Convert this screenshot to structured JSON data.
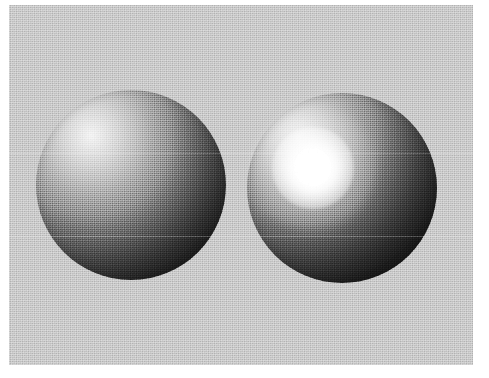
{
  "figure": {
    "kind": "shaded-sphere-illustration",
    "canvas": {
      "width": 489,
      "height": 378
    },
    "page_background": "#ffffff"
  },
  "panel": {
    "name": "scanned-image-panel",
    "x": 9,
    "y": 5,
    "width": 464,
    "height": 360,
    "background_color": "#c2c2c2",
    "texture": "halftone-dither"
  },
  "lighting": {
    "direction": "upper-left",
    "light_position_hint": "above and to the left of the viewer",
    "ambient_note": "terminator falls off to near-black toward the lower-right of each sphere"
  },
  "objects": [
    {
      "id": "sphere-diffuse",
      "name": "diffuse-sphere",
      "label": "Diffuse (Lambertian) sphere",
      "position": "left",
      "center_x": 131,
      "center_y": 185,
      "radius": 95,
      "shading_model": "Lambertian diffuse",
      "has_specular_highlight": false,
      "brightest_color": "#f2f2f2",
      "darkest_color": "#0d0d0d",
      "bright_spot_x": 91,
      "bright_spot_y": 136
    },
    {
      "id": "sphere-specular",
      "name": "specular-sphere",
      "label": "Specular (Phong) sphere",
      "position": "right",
      "center_x": 342,
      "center_y": 188,
      "radius": 95,
      "shading_model": "Phong diffuse plus specular",
      "has_specular_highlight": true,
      "brightest_color": "#ffffff",
      "darkest_color": "#0c0c0c",
      "highlight": {
        "name": "specular-highlight",
        "center_x": 313,
        "center_y": 168,
        "radius": 41,
        "core_color": "#ffffff",
        "glow_radius": 63
      }
    }
  ],
  "scan_seams": [
    {
      "name": "scan-seam-upper",
      "y": 153
    },
    {
      "name": "scan-seam-lower",
      "y": 236
    }
  ],
  "colors": {
    "background_gray": "#c2c2c2",
    "page_white": "#ffffff",
    "highlight_white": "#ffffff",
    "shadow_black": "#0c0c0c"
  }
}
